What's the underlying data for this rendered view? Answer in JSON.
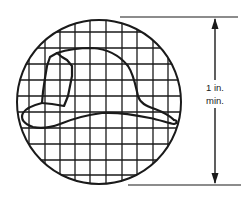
{
  "figure": {
    "dimension": {
      "value_line1": "1 in.",
      "value_line2": "min."
    },
    "colors": {
      "line": "#1a1a1a",
      "background": "#ffffff"
    }
  }
}
